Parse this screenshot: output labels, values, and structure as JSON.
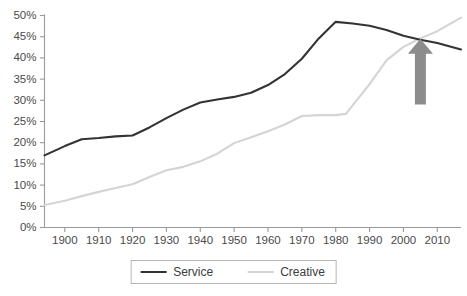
{
  "chart_data": {
    "type": "line",
    "title": "",
    "subtitle": "",
    "xlabel": "",
    "ylabel": "",
    "xlim": [
      1894,
      2017
    ],
    "ylim": [
      0,
      50
    ],
    "grid": false,
    "legend_position": "bottom",
    "y_ticks": [
      "0%",
      "5%",
      "10%",
      "15%",
      "20%",
      "25%",
      "30%",
      "35%",
      "40%",
      "45%",
      "50%"
    ],
    "y_tick_values": [
      0,
      5,
      10,
      15,
      20,
      25,
      30,
      35,
      40,
      45,
      50
    ],
    "x_ticks": [
      "1900",
      "1910",
      "1920",
      "1930",
      "1940",
      "1950",
      "1960",
      "1970",
      "1980",
      "1990",
      "2000",
      "2010"
    ],
    "x_tick_values": [
      1900,
      1910,
      1920,
      1930,
      1940,
      1950,
      1960,
      1970,
      1980,
      1990,
      2000,
      2010
    ],
    "series": [
      {
        "name": "Service",
        "color": "#333333",
        "width": 2.1,
        "x": [
          1894,
          1900,
          1905,
          1910,
          1915,
          1920,
          1925,
          1930,
          1935,
          1940,
          1945,
          1950,
          1955,
          1960,
          1965,
          1970,
          1975,
          1980,
          1985,
          1990,
          1995,
          2000,
          2005,
          2010,
          2017
        ],
        "values": [
          17.0,
          19.2,
          20.8,
          21.1,
          21.5,
          21.7,
          23.6,
          25.8,
          27.8,
          29.5,
          30.2,
          30.8,
          31.8,
          33.6,
          36.2,
          39.8,
          44.6,
          48.5,
          48.1,
          47.6,
          46.6,
          45.2,
          44.3,
          43.5,
          42.0
        ]
      },
      {
        "name": "Creative",
        "color": "#d4d4d4",
        "width": 2.1,
        "x": [
          1894,
          1900,
          1905,
          1910,
          1915,
          1920,
          1925,
          1930,
          1935,
          1940,
          1945,
          1950,
          1955,
          1960,
          1965,
          1970,
          1975,
          1980,
          1983,
          1990,
          1995,
          2000,
          2005,
          2010,
          2017
        ],
        "values": [
          5.3,
          6.3,
          7.4,
          8.4,
          9.3,
          10.2,
          11.9,
          13.5,
          14.3,
          15.6,
          17.4,
          19.9,
          21.3,
          22.7,
          24.3,
          26.3,
          26.5,
          26.5,
          26.8,
          33.8,
          39.4,
          42.6,
          44.6,
          46.3,
          49.5
        ]
      }
    ],
    "annotations": [
      {
        "type": "arrow",
        "direction": "up",
        "name": "crossover-arrow",
        "color": "#8c8c8c",
        "x_value": 2005,
        "y_value_tip": 44.5,
        "y_value_tail": 29.0,
        "note": "highlights crossover point where Creative overtakes Service"
      }
    ]
  },
  "legend": {
    "entries": [
      {
        "label": "Service",
        "color": "#333333"
      },
      {
        "label": "Creative",
        "color": "#d4d4d4"
      }
    ]
  }
}
